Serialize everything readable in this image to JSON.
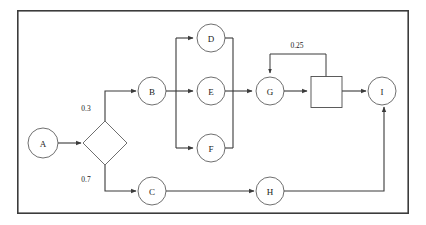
{
  "diagram": {
    "type": "flowchart",
    "frame": {
      "x": 17,
      "y": 10,
      "width": 392,
      "height": 204,
      "color": "#3c3c3c"
    },
    "colors": {
      "stroke": "#4a4a4a",
      "edge": "#3a3a3a",
      "fill": "#ffffff",
      "text": "#1a1a1a"
    },
    "nodes": [
      {
        "id": "A",
        "label": "A",
        "shape": "circle",
        "cx": 43,
        "cy": 143,
        "r": 15
      },
      {
        "id": "DEC",
        "label": "",
        "shape": "diamond",
        "cx": 105,
        "cy": 143,
        "rx": 22,
        "ry": 22
      },
      {
        "id": "B",
        "label": "B",
        "shape": "circle",
        "cx": 152,
        "cy": 91,
        "r": 14
      },
      {
        "id": "C",
        "label": "C",
        "shape": "circle",
        "cx": 152,
        "cy": 191,
        "r": 14
      },
      {
        "id": "D",
        "label": "D",
        "shape": "circle",
        "cx": 211,
        "cy": 38,
        "r": 14
      },
      {
        "id": "E",
        "label": "E",
        "shape": "circle",
        "cx": 211,
        "cy": 91,
        "r": 14
      },
      {
        "id": "F",
        "label": "F",
        "shape": "circle",
        "cx": 211,
        "cy": 148,
        "r": 14
      },
      {
        "id": "G",
        "label": "G",
        "shape": "circle",
        "cx": 270,
        "cy": 91,
        "r": 14
      },
      {
        "id": "SQ",
        "label": "",
        "shape": "square",
        "x": 311,
        "y": 77,
        "width": 31,
        "height": 31
      },
      {
        "id": "H",
        "label": "H",
        "shape": "circle",
        "cx": 270,
        "cy": 191,
        "r": 14
      },
      {
        "id": "I",
        "label": "I",
        "shape": "circle",
        "cx": 382,
        "cy": 91,
        "r": 14
      }
    ],
    "edge_labels": [
      {
        "id": "p-upper",
        "text": "0.3",
        "x": 86,
        "y": 108
      },
      {
        "id": "p-lower",
        "text": "0.7",
        "x": 86,
        "y": 179
      },
      {
        "id": "p-feedback",
        "text": "0.25",
        "x": 297,
        "y": 45
      }
    ],
    "edges": [
      {
        "from": "A",
        "to": "DEC",
        "arrow": true
      },
      {
        "from": "DEC",
        "to": "B",
        "arrow": true,
        "label": "0.3"
      },
      {
        "from": "DEC",
        "to": "C",
        "arrow": true,
        "label": "0.7"
      },
      {
        "from": "B",
        "to": "fan",
        "arrow": true
      },
      {
        "from": "fan",
        "to": "D",
        "arrow": true
      },
      {
        "from": "fan",
        "to": "E",
        "arrow": true
      },
      {
        "from": "fan",
        "to": "F",
        "arrow": true
      },
      {
        "from": "D",
        "to": "merge",
        "arrow": false
      },
      {
        "from": "E",
        "to": "merge",
        "arrow": false
      },
      {
        "from": "F",
        "to": "merge",
        "arrow": false
      },
      {
        "from": "merge",
        "to": "G",
        "arrow": true
      },
      {
        "from": "G",
        "to": "SQ",
        "arrow": true
      },
      {
        "from": "SQ",
        "to": "I",
        "arrow": true
      },
      {
        "from": "SQ",
        "to": "G",
        "arrow": true,
        "label": "0.25",
        "style": "feedback"
      },
      {
        "from": "C",
        "to": "H",
        "arrow": true
      },
      {
        "from": "H",
        "to": "I",
        "arrow": true
      }
    ]
  }
}
